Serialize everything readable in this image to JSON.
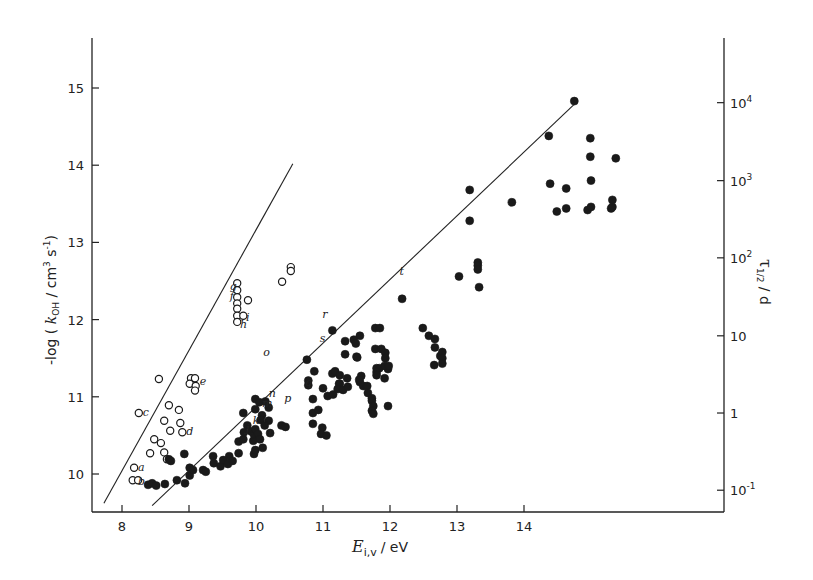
{
  "chart_data": {
    "type": "scatter",
    "title": "",
    "xlabel": "E_i,v / eV",
    "xlabel_main": "E",
    "xlabel_sub": "i,v",
    "xlabel_unit": "/ eV",
    "ylabel": "-log ( k_OH / cm^3 s^-1 )",
    "ylabel_parts": {
      "pre": "-log ( ",
      "k": "k",
      "sub": "OH",
      "mid": " / cm",
      "sup1": "3",
      "s": " s",
      "sup2": "-1",
      "post": ")"
    },
    "y2label": "τ_1/2 / d",
    "y2label_parts": {
      "tau": "τ",
      "sub": "1/2",
      "unit": " / d"
    },
    "xlim": [
      7.5,
      14.95
    ],
    "ylim": [
      9.55,
      15.6
    ],
    "grid": false,
    "x_ticks": [
      8,
      9,
      10,
      11,
      12,
      13,
      14
    ],
    "y_ticks": [
      10,
      11,
      12,
      13,
      14,
      15
    ],
    "y2_ticks": [
      {
        "label_base": "10",
        "label_exp": "-1",
        "y": 9.79
      },
      {
        "label_base": "1",
        "label_exp": "",
        "y": 10.79
      },
      {
        "label_base": "10",
        "label_exp": "",
        "y": 11.79
      },
      {
        "label_base": "10",
        "label_exp": "2",
        "y": 12.8
      },
      {
        "label_base": "10",
        "label_exp": "3",
        "y": 13.8
      },
      {
        "label_base": "10",
        "label_exp": "4",
        "y": 14.81
      }
    ],
    "series": [
      {
        "name": "open circles",
        "marker": "open-circle",
        "points": [
          [
            8.18,
            10.08
          ],
          [
            8.16,
            9.92
          ],
          [
            8.24,
            9.92
          ],
          [
            8.25,
            10.79
          ],
          [
            8.55,
            11.23
          ],
          [
            9.03,
            11.24
          ],
          [
            9.09,
            11.24
          ],
          [
            9.01,
            11.17
          ],
          [
            9.1,
            11.14
          ],
          [
            9.09,
            11.08
          ],
          [
            8.7,
            10.89
          ],
          [
            8.85,
            10.83
          ],
          [
            8.63,
            10.69
          ],
          [
            8.72,
            10.56
          ],
          [
            8.87,
            10.66
          ],
          [
            8.9,
            10.54
          ],
          [
            8.48,
            10.45
          ],
          [
            8.58,
            10.4
          ],
          [
            8.42,
            10.27
          ],
          [
            8.63,
            10.28
          ],
          [
            8.67,
            10.19
          ],
          [
            9.72,
            12.47
          ],
          [
            9.72,
            12.38
          ],
          [
            9.72,
            12.29
          ],
          [
            9.72,
            12.21
          ],
          [
            9.72,
            12.14
          ],
          [
            9.72,
            12.05
          ],
          [
            9.72,
            11.97
          ],
          [
            9.88,
            12.25
          ],
          [
            9.81,
            12.05
          ],
          [
            10.39,
            12.49
          ],
          [
            10.52,
            12.68
          ],
          [
            10.52,
            12.63
          ]
        ]
      },
      {
        "name": "filled circles",
        "marker": "filled-circle",
        "points": [
          [
            8.39,
            9.86
          ],
          [
            8.45,
            9.88
          ],
          [
            8.51,
            9.85
          ],
          [
            8.64,
            9.87
          ],
          [
            8.82,
            9.92
          ],
          [
            8.94,
            9.88
          ],
          [
            9.01,
            9.98
          ],
          [
            9.01,
            10.08
          ],
          [
            9.06,
            10.05
          ],
          [
            9.21,
            10.05
          ],
          [
            9.25,
            10.03
          ],
          [
            8.7,
            10.19
          ],
          [
            8.73,
            10.17
          ],
          [
            8.93,
            10.26
          ],
          [
            9.36,
            10.23
          ],
          [
            9.37,
            10.14
          ],
          [
            9.47,
            10.1
          ],
          [
            9.51,
            10.18
          ],
          [
            9.58,
            10.13
          ],
          [
            9.6,
            10.23
          ],
          [
            9.65,
            10.17
          ],
          [
            9.74,
            10.27
          ],
          [
            9.74,
            10.42
          ],
          [
            9.81,
            10.45
          ],
          [
            9.82,
            10.54
          ],
          [
            9.87,
            10.63
          ],
          [
            9.93,
            10.55
          ],
          [
            9.96,
            10.43
          ],
          [
            9.97,
            10.51
          ],
          [
            9.97,
            10.26
          ],
          [
            9.81,
            10.79
          ],
          [
            10.14,
            10.94
          ],
          [
            10.19,
            10.86
          ],
          [
            10.19,
            10.69
          ],
          [
            9.99,
            10.97
          ],
          [
            10.05,
            10.93
          ],
          [
            9.99,
            10.84
          ],
          [
            10.09,
            10.76
          ],
          [
            10.07,
            10.7
          ],
          [
            10.13,
            10.63
          ],
          [
            9.99,
            10.58
          ],
          [
            10.03,
            10.52
          ],
          [
            10.06,
            10.45
          ],
          [
            10.1,
            10.34
          ],
          [
            9.99,
            10.31
          ],
          [
            10.21,
            10.53
          ],
          [
            10.38,
            10.63
          ],
          [
            10.44,
            10.61
          ],
          [
            10.85,
            10.97
          ],
          [
            10.85,
            10.79
          ],
          [
            10.93,
            10.83
          ],
          [
            10.85,
            10.65
          ],
          [
            10.99,
            10.6
          ],
          [
            10.97,
            10.52
          ],
          [
            11.05,
            10.5
          ],
          [
            10.78,
            11.15
          ],
          [
            11.0,
            11.11
          ],
          [
            11.24,
            11.17
          ],
          [
            11.07,
            11.01
          ],
          [
            11.15,
            11.03
          ],
          [
            11.14,
            11.86
          ],
          [
            11.78,
            11.89
          ],
          [
            11.85,
            11.89
          ],
          [
            11.46,
            11.74
          ],
          [
            11.55,
            11.79
          ],
          [
            11.49,
            11.69
          ],
          [
            11.33,
            11.72
          ],
          [
            11.33,
            11.55
          ],
          [
            11.5,
            11.52
          ],
          [
            11.78,
            11.62
          ],
          [
            11.87,
            11.62
          ],
          [
            11.93,
            11.57
          ],
          [
            11.93,
            11.5
          ],
          [
            10.76,
            11.48
          ],
          [
            10.87,
            11.33
          ],
          [
            10.78,
            11.21
          ],
          [
            11.51,
            11.51
          ],
          [
            11.8,
            11.37
          ],
          [
            11.84,
            11.37
          ],
          [
            11.8,
            11.32
          ],
          [
            11.8,
            11.28
          ],
          [
            11.97,
            11.36
          ],
          [
            11.14,
            11.3
          ],
          [
            11.18,
            11.33
          ],
          [
            11.25,
            11.28
          ],
          [
            11.25,
            11.17
          ],
          [
            11.36,
            11.24
          ],
          [
            11.22,
            11.1
          ],
          [
            11.3,
            11.09
          ],
          [
            11.37,
            11.13
          ],
          [
            11.57,
            11.27
          ],
          [
            11.55,
            11.19
          ],
          [
            11.6,
            11.14
          ],
          [
            11.54,
            11.22
          ],
          [
            11.66,
            11.14
          ],
          [
            11.67,
            11.05
          ],
          [
            11.73,
            10.98
          ],
          [
            11.73,
            10.95
          ],
          [
            11.75,
            10.88
          ],
          [
            11.73,
            10.82
          ],
          [
            11.97,
            10.88
          ],
          [
            11.75,
            10.78
          ],
          [
            11.92,
            11.4
          ],
          [
            11.92,
            11.24
          ],
          [
            11.98,
            11.4
          ],
          [
            12.18,
            12.27
          ],
          [
            12.66,
            11.41
          ],
          [
            12.75,
            11.53
          ],
          [
            12.58,
            11.79
          ],
          [
            12.49,
            11.89
          ],
          [
            12.67,
            11.75
          ],
          [
            12.67,
            11.64
          ],
          [
            12.78,
            11.58
          ],
          [
            12.78,
            11.5
          ],
          [
            12.78,
            11.43
          ],
          [
            13.31,
            12.74
          ],
          [
            13.31,
            12.7
          ],
          [
            13.31,
            12.65
          ],
          [
            13.33,
            12.42
          ],
          [
            13.03,
            12.56
          ],
          [
            13.19,
            13.68
          ],
          [
            13.19,
            13.28
          ],
          [
            13.82,
            13.52
          ],
          [
            14.39,
            13.76
          ],
          [
            14.49,
            13.4
          ],
          [
            14.75,
            14.83
          ],
          [
            14.37,
            14.38
          ],
          [
            14.99,
            14.35
          ],
          [
            14.99,
            14.11
          ],
          [
            15.37,
            14.09
          ],
          [
            14.63,
            13.7
          ],
          [
            15.0,
            13.8
          ],
          [
            14.63,
            13.44
          ],
          [
            14.95,
            13.42
          ],
          [
            15.0,
            13.46
          ],
          [
            15.3,
            13.44
          ],
          [
            15.32,
            13.46
          ],
          [
            15.32,
            13.55
          ]
        ]
      }
    ],
    "fit_lines": [
      {
        "name": "steep (open)",
        "from": [
          7.73,
          9.62
        ],
        "to": [
          10.55,
          14.02
        ]
      },
      {
        "name": "main (filled)",
        "from": [
          8.45,
          9.59
        ],
        "to": [
          14.8,
          14.83
        ]
      }
    ],
    "annotations": [
      {
        "text": "a",
        "x": 8.24,
        "y": 10.09
      },
      {
        "text": "b",
        "x": 8.24,
        "y": 9.91
      },
      {
        "text": "c",
        "x": 8.31,
        "y": 10.8
      },
      {
        "text": "d",
        "x": 8.96,
        "y": 10.56
      },
      {
        "text": "e",
        "x": 9.16,
        "y": 11.2
      },
      {
        "text": "f",
        "x": 9.61,
        "y": 12.31
      },
      {
        "text": "g",
        "x": 9.61,
        "y": 12.43
      },
      {
        "text": "h",
        "x": 9.76,
        "y": 11.94
      },
      {
        "text": "i",
        "x": 9.85,
        "y": 12.04
      },
      {
        "text": "j",
        "x": 9.85,
        "y": 10.6
      },
      {
        "text": "k",
        "x": 9.95,
        "y": 10.7
      },
      {
        "text": "l",
        "x": 10.18,
        "y": 10.53
      },
      {
        "text": "m",
        "x": 10.09,
        "y": 10.92
      },
      {
        "text": "n",
        "x": 10.19,
        "y": 11.05
      },
      {
        "text": "o",
        "x": 10.11,
        "y": 11.58
      },
      {
        "text": "p",
        "x": 10.42,
        "y": 10.99
      },
      {
        "text": "q",
        "x": 10.73,
        "y": 11.19
      },
      {
        "text": "r",
        "x": 10.99,
        "y": 12.07
      },
      {
        "text": "s",
        "x": 10.95,
        "y": 11.76
      },
      {
        "text": "t",
        "x": 12.14,
        "y": 12.63
      }
    ]
  }
}
